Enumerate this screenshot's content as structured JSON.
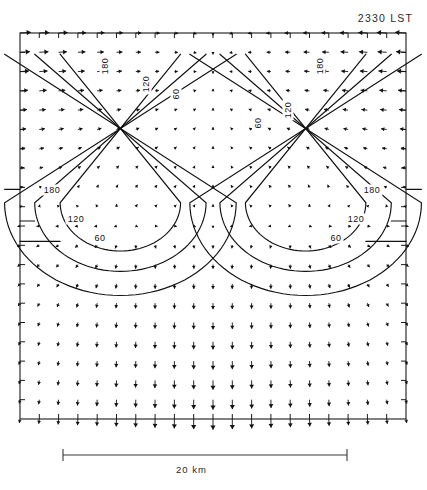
{
  "figure": {
    "timestamp_label": "2330 LST",
    "scale_label": "20 km",
    "domain": "Mesoscale horizontal wind vector field with streamfunction/height contours"
  },
  "chart_data": {
    "type": "scatter",
    "title": "2330 LST",
    "subtitle": "",
    "xlabel": "",
    "ylabel": "",
    "grid": false,
    "legend": "none",
    "axis_ranges": {
      "x": [
        0,
        36
      ],
      "y": [
        0,
        36
      ]
    },
    "scale_bar": {
      "label": "20 km",
      "length_km": 20,
      "px_start": 63,
      "px_end": 347
    },
    "contour_levels": [
      60,
      120,
      180
    ],
    "contour_units": "m",
    "contour_labels": [
      {
        "text": "180",
        "x": 105,
        "y": 66,
        "orientation": "vertical"
      },
      {
        "text": "120",
        "x": 146,
        "y": 84,
        "orientation": "vertical"
      },
      {
        "text": "60",
        "x": 176,
        "y": 94,
        "orientation": "vertical"
      },
      {
        "text": "180",
        "x": 320,
        "y": 66,
        "orientation": "vertical"
      },
      {
        "text": "120",
        "x": 288,
        "y": 110,
        "orientation": "vertical"
      },
      {
        "text": "60",
        "x": 258,
        "y": 123,
        "orientation": "vertical"
      },
      {
        "text": "180",
        "x": 52,
        "y": 190,
        "orientation": "horizontal"
      },
      {
        "text": "120",
        "x": 76,
        "y": 219,
        "orientation": "horizontal"
      },
      {
        "text": "60",
        "x": 100,
        "y": 238,
        "orientation": "horizontal"
      },
      {
        "text": "180",
        "x": 372,
        "y": 190,
        "orientation": "horizontal"
      },
      {
        "text": "120",
        "x": 356,
        "y": 219,
        "orientation": "horizontal"
      },
      {
        "text": "60",
        "x": 336,
        "y": 238,
        "orientation": "horizontal"
      }
    ],
    "vector_field": {
      "description": "Arrows converge horizontally toward the centerline in the upper half, then turn and diverge radially downward/outward from two cyclonic centers in the lower half.",
      "grid_nx": 20,
      "grid_ny": 20,
      "max_arrow_px": 13
    },
    "plot_frame": {
      "left": 20,
      "top": 33,
      "right": 406,
      "bottom": 419
    },
    "tick_count_per_side": 20
  }
}
